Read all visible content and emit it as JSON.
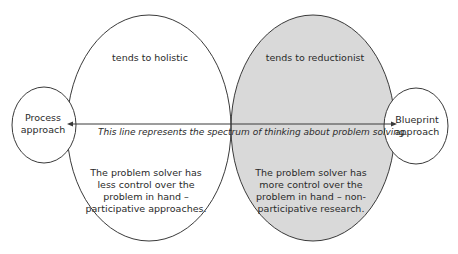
{
  "diagram": {
    "left_circle": {
      "heading": "tends to holistic",
      "body": "The problem solver has less control over the problem in hand – participative approaches.",
      "fill": "#ffffff"
    },
    "right_circle": {
      "heading": "tends to reductionist",
      "body": "The problem solver has more control over the problem in hand – non-participative research.",
      "fill": "#d9d9d9"
    },
    "left_end": {
      "label": "Process approach"
    },
    "right_end": {
      "label": "Blueprint approach"
    },
    "spectrum_line": {
      "caption": "This line represents the spectrum of thinking about problem solving.",
      "arrowheads": "both"
    },
    "colors": {
      "stroke": "#3a3a3a",
      "shaded": "#d9d9d9",
      "text": "#2a2a2a"
    }
  }
}
